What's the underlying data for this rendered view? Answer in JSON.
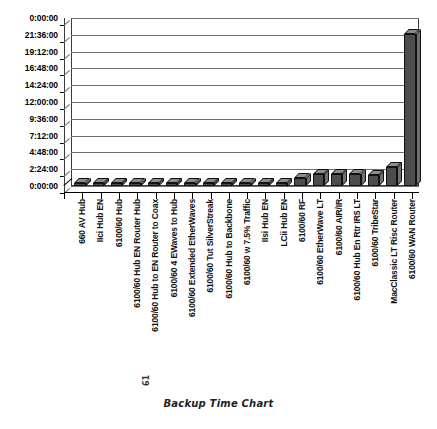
{
  "caption": "Backup Time Chart",
  "folio": "61",
  "chart_data": {
    "type": "bar",
    "title": "Backup Time Chart",
    "xlabel": "",
    "ylabel": "",
    "ylim": [
      "0:00:00",
      "24:00:00"
    ],
    "grid": true,
    "legend": "none",
    "y_ticks": [
      "0:00:00",
      "21:36:00",
      "19:12:00",
      "16:48:00",
      "14:24:00",
      "12:00:00",
      "9:36:00",
      "7:12:00",
      "4:48:00",
      "2:24:00",
      "0:00:00"
    ],
    "y_tick_seconds": [
      86400,
      77760,
      69120,
      60480,
      51840,
      43200,
      34560,
      25920,
      17280,
      8640,
      0
    ],
    "categories": [
      "660 AV Hub",
      "IIci Hub EN",
      "6100/60 Hub",
      "6100/60 Hub EN Router Hub",
      "6100/60 Hub to EN Router to Coax",
      "6100/60 4 EWaves to Hub",
      "6100/60 Extended EtherWaves",
      "6100/60 Tut SilverStreak",
      "6100/60 Hub to Backbone",
      "6100/60 w 7.5% Traffic",
      "IIsi Hub EN",
      "LCii Hub EN",
      "6100/60 RF",
      "6100/60 EtherWave LT",
      "6100/60 AIR/IR",
      "6100/60 Hub En Rtr IR5 LT",
      "6100/60 TribeStar",
      "MacClassic LT Risc Router",
      "6100/60 WAN Router"
    ],
    "values": [
      "0:12:00",
      "0:14:00",
      "0:15:00",
      "0:16:00",
      "0:17:00",
      "0:18:00",
      "0:19:00",
      "0:20:00",
      "0:22:00",
      "0:24:00",
      "0:26:00",
      "0:30:00",
      "1:12:00",
      "1:40:00",
      "1:42:00",
      "1:40:00",
      "1:38:00",
      "2:40:00",
      "21:40:00"
    ],
    "values_seconds": [
      720,
      840,
      900,
      960,
      1020,
      1080,
      1140,
      1200,
      1320,
      1440,
      1560,
      1800,
      4320,
      6000,
      6120,
      6000,
      5880,
      9600,
      78000
    ],
    "bar_color": "#4d4d4d",
    "bar_top_color": "#8c8c8c",
    "bar_side_color": "#707070",
    "grid_color": "#6e6e6e",
    "axis_color": "#000000"
  }
}
